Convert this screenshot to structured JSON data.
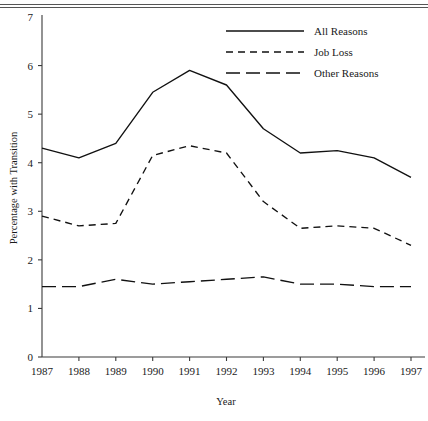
{
  "chart_data": {
    "type": "line",
    "title": "",
    "xlabel": "Year",
    "ylabel": "Percentage with Transition",
    "x": [
      1987,
      1988,
      1989,
      1990,
      1991,
      1992,
      1993,
      1994,
      1995,
      1996,
      1997
    ],
    "xtick_labels": [
      "1987",
      "1988",
      "1989",
      "1990",
      "1991",
      "1992",
      "1993",
      "1994",
      "1995",
      "1996",
      "1997"
    ],
    "ytick_labels": [
      "0",
      "1",
      "2",
      "3",
      "4",
      "5",
      "6",
      "7"
    ],
    "ylim": [
      0,
      7
    ],
    "xlim": [
      1987,
      1997
    ],
    "grid": false,
    "legend_position": "top-right",
    "series": [
      {
        "name": "All Reasons",
        "style": "solid",
        "values": [
          4.3,
          4.1,
          4.4,
          5.45,
          5.9,
          5.6,
          4.7,
          4.2,
          4.25,
          4.1,
          3.7
        ]
      },
      {
        "name": "Job Loss",
        "style": "dashed",
        "values": [
          2.9,
          2.7,
          2.75,
          4.15,
          4.35,
          4.2,
          3.2,
          2.65,
          2.7,
          2.65,
          2.3
        ]
      },
      {
        "name": "Other Reasons",
        "style": "longdash",
        "values": [
          1.45,
          1.45,
          1.6,
          1.5,
          1.55,
          1.6,
          1.65,
          1.5,
          1.5,
          1.45,
          1.45
        ]
      }
    ]
  },
  "axes": {
    "y_title": "Percentage with Transition",
    "x_title": "Year"
  },
  "legend": {
    "items": [
      {
        "label": "All Reasons",
        "style": "solid"
      },
      {
        "label": "Job Loss",
        "style": "dashed"
      },
      {
        "label": "Other Reasons",
        "style": "longdash"
      }
    ]
  },
  "colors": {
    "line": "#111111",
    "axis": "#3a3a3a",
    "background": "#ffffff"
  }
}
